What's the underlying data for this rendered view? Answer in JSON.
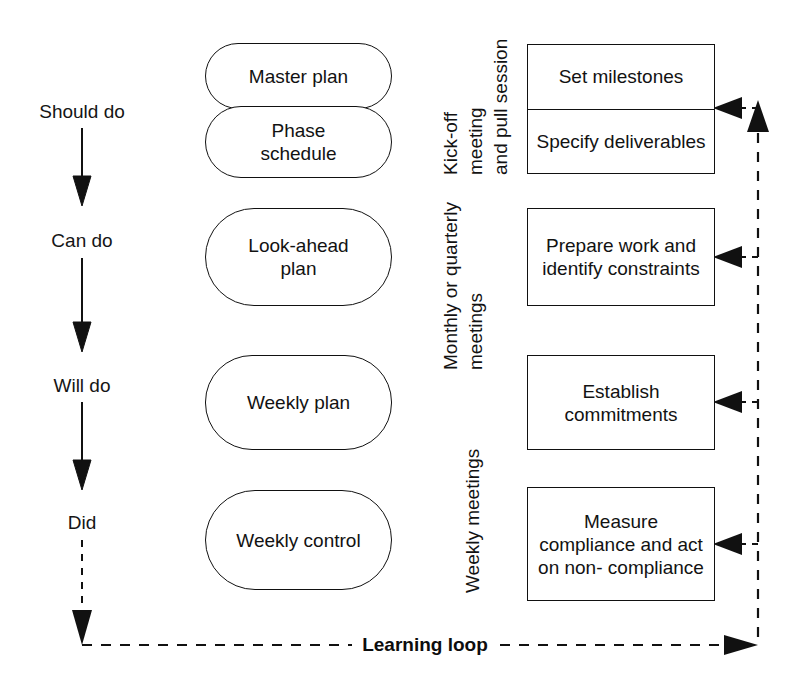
{
  "diagram": {
    "stages": [
      {
        "label": "Should do",
        "x": 82,
        "y": 112
      },
      {
        "label": "Can do",
        "x": 82,
        "y": 241
      },
      {
        "label": "Will do",
        "x": 82,
        "y": 386
      },
      {
        "label": "Did",
        "x": 82,
        "y": 523
      }
    ],
    "plans": [
      {
        "lines": [
          "Master plan"
        ],
        "x": 205,
        "y": 43,
        "w": 187,
        "h": 66
      },
      {
        "lines": [
          "Phase",
          "schedule"
        ],
        "x": 205,
        "y": 106,
        "w": 187,
        "h": 72
      },
      {
        "lines": [
          "Look-ahead",
          "plan"
        ],
        "x": 205,
        "y": 208,
        "w": 187,
        "h": 98
      },
      {
        "lines": [
          "Weekly plan"
        ],
        "x": 205,
        "y": 355,
        "w": 187,
        "h": 95
      },
      {
        "lines": [
          "Weekly control"
        ],
        "x": 205,
        "y": 490,
        "w": 187,
        "h": 100
      }
    ],
    "meeting_labels": [
      {
        "lines": [
          "Kick-off",
          "meeting",
          "and pull session"
        ],
        "x": 458,
        "y": 175,
        "name": "kickoff-meeting-label"
      },
      {
        "lines": [
          "Monthly or quarterly",
          "meetings"
        ],
        "x": 458,
        "y": 345,
        "name": "monthly-quarterly-meetings-label"
      },
      {
        "lines": [
          "Weekly meetings"
        ],
        "x": 470,
        "y": 593,
        "name": "weekly-meetings-label"
      }
    ],
    "activities": [
      {
        "name": "activity-box-kickoff",
        "x": 527,
        "y": 44,
        "w": 188,
        "h": 130,
        "cells": [
          {
            "lines": [
              "Set milestones"
            ]
          },
          {
            "lines": [
              "Specify",
              "deliverables"
            ]
          }
        ]
      },
      {
        "name": "activity-box-lookahead",
        "x": 527,
        "y": 208,
        "w": 188,
        "h": 98,
        "cells": [
          {
            "lines": [
              "Prepare work",
              "and identify",
              "constraints"
            ]
          }
        ]
      },
      {
        "name": "activity-box-weekly-plan",
        "x": 527,
        "y": 355,
        "w": 188,
        "h": 95,
        "cells": [
          {
            "lines": [
              "Establish",
              "commitments"
            ]
          }
        ]
      },
      {
        "name": "activity-box-weekly-control",
        "x": 527,
        "y": 487,
        "w": 188,
        "h": 114,
        "cells": [
          {
            "lines": [
              "Measure",
              "compliance and",
              "act on non-",
              "compliance"
            ]
          }
        ]
      }
    ],
    "feedback_arrow_targets": [
      108,
      257,
      402,
      544
    ],
    "loop": {
      "caption": "Learning loop",
      "caption_x": 425,
      "caption_y": 645,
      "baseline_y": 645,
      "left_x": 82,
      "right_x": 758,
      "top_y": 108
    },
    "colors": {
      "stroke": "#111111",
      "text": "#121212",
      "background": "#ffffff"
    }
  }
}
